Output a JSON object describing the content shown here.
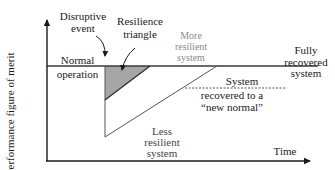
{
  "diagram": {
    "axes": {
      "y_label": "Performance figure of merit",
      "x_label": "Time"
    },
    "labels": {
      "disruptive_event_line1": "Disruptive",
      "disruptive_event_line2": "event",
      "resilience_triangle_line1": "Resilience",
      "resilience_triangle_line2": "triangle",
      "normal_operation_line1": "Normal",
      "normal_operation_line2": "operation",
      "more_resilient_line1": "More",
      "more_resilient_line2": "resilient",
      "more_resilient_line3": "system",
      "fully_recovered_line1": "Fully",
      "fully_recovered_line2": "recovered",
      "fully_recovered_line3": "system",
      "new_normal_line1": "System",
      "new_normal_line2": "recovered to a",
      "new_normal_line3": "“new normal”",
      "less_resilient_line1": "Less",
      "less_resilient_line2": "resilient",
      "less_resilient_line3": "system"
    },
    "colors": {
      "axis": "#1a1a1a",
      "baseline": "#333333",
      "triangle_fill": "#a6a6a6",
      "less_resilient_line": "#555555",
      "gray_text": "#8a8a8a"
    }
  }
}
